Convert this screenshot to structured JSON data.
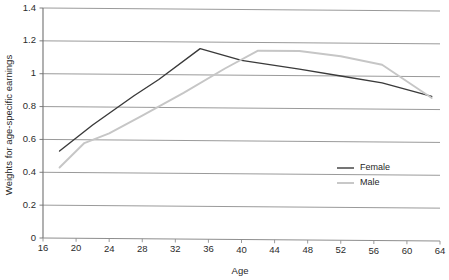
{
  "chart_data": {
    "type": "line",
    "title": "",
    "xlabel": "Age",
    "ylabel": "Weights for age-specific earnings",
    "xlim": [
      16,
      64
    ],
    "ylim": [
      0,
      1.4
    ],
    "grid": true,
    "grid_axis": "y",
    "legend_position": "center-right-inside",
    "xticks": [
      16,
      20,
      24,
      28,
      32,
      36,
      40,
      44,
      48,
      52,
      56,
      60,
      64
    ],
    "xtick_labels": [
      "16",
      "20",
      "24",
      "28",
      "32",
      "36",
      "40",
      "44",
      "48",
      "52",
      "56",
      "60",
      "64"
    ],
    "yticks": [
      0,
      0.2,
      0.4,
      0.6,
      0.8,
      1,
      1.2,
      1.4
    ],
    "ytick_labels": [
      "0",
      "0.2",
      "0.4",
      "0.6",
      "0.8",
      "1",
      "1.2",
      "1.4"
    ],
    "series": [
      {
        "name": "Female",
        "color": "#3a3a3a",
        "x": [
          18,
          22,
          27,
          30,
          35,
          40,
          47,
          52,
          57,
          63
        ],
        "values": [
          0.53,
          0.69,
          0.87,
          0.97,
          1.16,
          1.09,
          1.04,
          1.0,
          0.96,
          0.88
        ]
      },
      {
        "name": "Male",
        "color": "#c6c6c6",
        "x": [
          18,
          21,
          24,
          28,
          33,
          38,
          42,
          47,
          52,
          57,
          63
        ],
        "values": [
          0.43,
          0.58,
          0.64,
          0.75,
          0.89,
          1.04,
          1.15,
          1.15,
          1.12,
          1.07,
          0.87
        ]
      }
    ]
  },
  "legend": {
    "entries": [
      {
        "label": "Female",
        "color": "#3a3a3a"
      },
      {
        "label": "Male",
        "color": "#c6c6c6"
      }
    ]
  },
  "axis": {
    "x_title": "Age",
    "y_title": "Weights for age-specific earnings"
  }
}
